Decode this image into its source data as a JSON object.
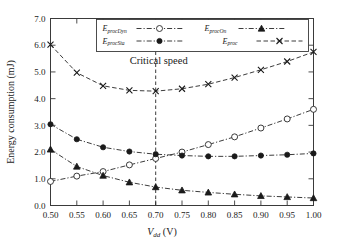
{
  "chart_data": {
    "type": "line",
    "title": "",
    "xlabel": "V_dd (V)",
    "ylabel": "Energy consumption (mJ)",
    "xlim": [
      0.5,
      1.0
    ],
    "ylim": [
      0.0,
      7.0
    ],
    "grid": false,
    "legend_position": "top-center",
    "x": [
      0.5,
      0.55,
      0.6,
      0.65,
      0.7,
      0.75,
      0.8,
      0.85,
      0.9,
      0.95,
      1.0
    ],
    "xtick_labels": [
      "0.50",
      "0.55",
      "0.60",
      "0.65",
      "0.70",
      "0.75",
      "0.80",
      "0.85",
      "0.90",
      "0.95",
      "1.00"
    ],
    "ytick_labels": [
      "0.0",
      "1.0",
      "2.0",
      "3.0",
      "4.0",
      "5.0",
      "6.0",
      "7.0"
    ],
    "yticks": [
      0.0,
      1.0,
      2.0,
      3.0,
      4.0,
      5.0,
      6.0,
      7.0
    ],
    "series": [
      {
        "name": "E_procDyn",
        "label_main": "E",
        "label_sub": "procDyn",
        "marker": "open-circle",
        "linestyle": "dash-dot",
        "values": [
          0.9,
          1.1,
          1.27,
          1.52,
          1.76,
          2.0,
          2.28,
          2.57,
          2.9,
          3.24,
          3.6
        ]
      },
      {
        "name": "E_procSta",
        "label_main": "E",
        "label_sub": "procSta",
        "marker": "filled-circle",
        "linestyle": "dash-dot",
        "values": [
          3.04,
          2.48,
          2.18,
          2.02,
          1.92,
          1.87,
          1.84,
          1.84,
          1.87,
          1.9,
          1.95
        ]
      },
      {
        "name": "E_procOn",
        "label_main": "E",
        "label_sub": "procOn",
        "marker": "filled-triangle",
        "linestyle": "dash-dot",
        "values": [
          2.1,
          1.46,
          1.12,
          0.87,
          0.69,
          0.57,
          0.49,
          0.42,
          0.36,
          0.32,
          0.28
        ]
      },
      {
        "name": "E_proc",
        "label_main": "E",
        "label_sub": "proc",
        "marker": "x",
        "linestyle": "dashed",
        "values": [
          6.02,
          4.97,
          4.48,
          4.31,
          4.28,
          4.37,
          4.54,
          4.79,
          5.08,
          5.39,
          5.75
        ]
      }
    ],
    "annotations": [
      {
        "name": "critical-speed",
        "text": "Critical speed",
        "x": 0.7,
        "line": "vertical-dashed"
      }
    ]
  },
  "axis": {
    "ylabel_text": "Energy consumption (mJ)",
    "xlabel_main": "V",
    "xlabel_sub": "dd",
    "xlabel_unit": "(V)"
  }
}
